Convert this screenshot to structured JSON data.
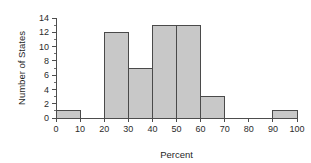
{
  "chart_data": {
    "type": "bar",
    "title": "",
    "subtitle": "",
    "xlabel": "Percent",
    "ylabel": "Number of States",
    "categories": [
      "0-10",
      "10-20",
      "20-30",
      "30-40",
      "40-50",
      "50-60",
      "60-70",
      "70-80",
      "80-90",
      "90-100"
    ],
    "bin_edges": [
      0,
      10,
      20,
      30,
      40,
      50,
      60,
      70,
      80,
      90,
      100
    ],
    "values": [
      1,
      0,
      12,
      7,
      13,
      13,
      3,
      0,
      0,
      1
    ],
    "bin_width": 10,
    "xlim": [
      0,
      100
    ],
    "ylim": [
      0,
      14
    ],
    "xticks": [
      0,
      10,
      20,
      30,
      40,
      50,
      60,
      70,
      80,
      90,
      100
    ],
    "yticks": [
      0,
      2,
      4,
      6,
      8,
      10,
      12,
      14
    ],
    "yticks_minor": [
      1,
      3,
      5,
      7,
      9,
      11,
      13
    ],
    "xtick_labels": [
      "0",
      "10",
      "20",
      "30",
      "40",
      "50",
      "60",
      "70",
      "80",
      "90",
      "100"
    ],
    "ytick_labels": [
      "0",
      "2",
      "4",
      "6",
      "8",
      "10",
      "12",
      "14"
    ],
    "grid": false,
    "legend": null,
    "legend_position": "none",
    "annotations": [],
    "colors": {
      "bar_fill": "#c8c8c8",
      "bar_stroke": "#4a4a4a",
      "axis": "#4d4d4d",
      "text": "#1f1f1f",
      "background": "#ffffff"
    }
  }
}
